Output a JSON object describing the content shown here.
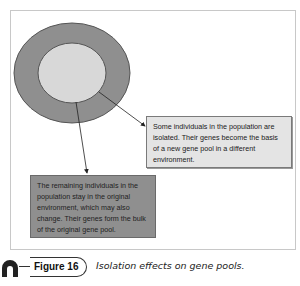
{
  "diagram": {
    "outer_ring_color": "#8f8f8f",
    "inner_circle_color": "#d8d8d8",
    "box_right": {
      "text": "Some individuals in the population are isolated. Their genes become the basis of a new gene pool in a different environment."
    },
    "box_left": {
      "text": "The remaining individuals in the population stay in the original environment, which may also change. Their genes form the bulk of the original gene pool."
    }
  },
  "caption": {
    "figure_label": "Figure 16",
    "text": "Isolation effects on gene pools."
  }
}
